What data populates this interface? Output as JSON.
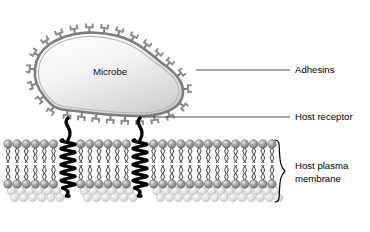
{
  "figure": {
    "title_visible": false,
    "background": "#ffffff"
  },
  "microbe": {
    "label": "Microbe",
    "shape": "bean",
    "wall_color": "#8a8a8a",
    "fill_light": "#fdfdfd",
    "fill_dark": "#d2d2d2",
    "adhesin_count": 26
  },
  "labels": [
    {
      "id": "adhesins",
      "text": "Adhesins",
      "x": 295,
      "y": 70
    },
    {
      "id": "host-receptor",
      "text": "Host receptor",
      "x": 295,
      "y": 117
    },
    {
      "id": "host-plasma-membrane",
      "line1": "Host plasma",
      "line2": "membrane",
      "x": 295,
      "y": 172
    }
  ],
  "leaders": [
    {
      "id": "adhesins-leader",
      "x1": 196,
      "y1": 70,
      "x2": 290,
      "y2": 70
    },
    {
      "id": "host-receptor-leader",
      "x1": 141,
      "y1": 117,
      "x2": 290,
      "y2": 117
    }
  ],
  "brace": {
    "id": "membrane-brace",
    "x": 280,
    "y_top": 140,
    "y_bottom": 205,
    "color": "#000000"
  },
  "membrane": {
    "name": "Host plasma membrane",
    "x_left": 8,
    "x_right": 272,
    "head_color_front": "#8e8e8e",
    "head_color_back": "#dcdcdc",
    "tail_color": "#1a1a1a",
    "upper_head_y": 144,
    "lower_head_y": 184,
    "perspective_rows": 2,
    "lipid_count_per_leaflet": 30
  },
  "receptors": [
    {
      "id": "receptor-left",
      "x": 68,
      "coils": 6,
      "color": "#000000"
    },
    {
      "id": "receptor-right",
      "x": 140,
      "coils": 6,
      "color": "#000000"
    }
  ],
  "colors": {
    "ink": "#000000",
    "gray_mid": "#8a8a8a",
    "gray_light": "#d8d8d8",
    "leader_line": "#555555"
  }
}
